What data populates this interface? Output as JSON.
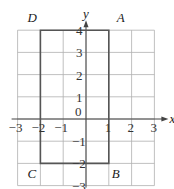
{
  "diagram": {
    "type": "coordinate-grid",
    "axes": {
      "x_label": "x",
      "y_label": "y",
      "x_range": [
        -3,
        3
      ],
      "y_range": [
        -3,
        4
      ],
      "origin_label": "0",
      "x_ticks": [
        "-3",
        "-2",
        "-1",
        "1",
        "2",
        "3"
      ],
      "y_ticks": [
        "4",
        "3",
        "2",
        "1",
        "-1",
        "-2",
        "-3"
      ]
    },
    "rectangle": {
      "vertices": [
        {
          "name": "A",
          "x": 1,
          "y": 4
        },
        {
          "name": "B",
          "x": 1,
          "y": -2
        },
        {
          "name": "C",
          "x": -2,
          "y": -2
        },
        {
          "name": "D",
          "x": -2,
          "y": 4
        }
      ]
    },
    "colors": {
      "grid": "#b0b0b0",
      "axis": "#444444",
      "rectangle": "#555555"
    }
  }
}
